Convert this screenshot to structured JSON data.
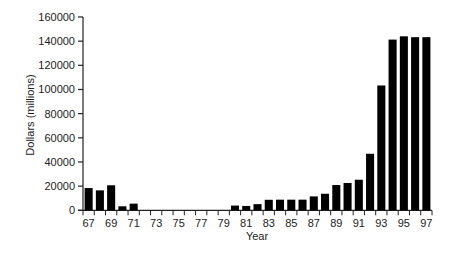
{
  "chart_data": {
    "type": "bar",
    "title": "",
    "xlabel": "Year",
    "ylabel": "Dollars (millions)",
    "ylim": [
      0,
      160000
    ],
    "yticks": [
      0,
      20000,
      40000,
      60000,
      80000,
      100000,
      120000,
      140000,
      160000
    ],
    "xtick_labels": [
      "67",
      "69",
      "71",
      "73",
      "75",
      "77",
      "79",
      "81",
      "83",
      "85",
      "87",
      "89",
      "91",
      "93",
      "95",
      "97"
    ],
    "grid": false,
    "legend": null,
    "bar_color": "#000000",
    "categories": [
      "67",
      "68",
      "69",
      "70",
      "71",
      "72",
      "73",
      "74",
      "75",
      "76",
      "77",
      "78",
      "79",
      "80",
      "81",
      "82",
      "83",
      "84",
      "85",
      "86",
      "87",
      "88",
      "89",
      "90",
      "91",
      "92",
      "93",
      "94",
      "95",
      "96",
      "97"
    ],
    "values": [
      18400,
      16500,
      20700,
      3300,
      5500,
      0,
      0,
      0,
      0,
      0,
      0,
      0,
      0,
      3900,
      3600,
      5100,
      8700,
      8800,
      8800,
      8800,
      11500,
      13700,
      20900,
      22600,
      25300,
      46800,
      103300,
      141300,
      144000,
      143300,
      143300
    ]
  }
}
